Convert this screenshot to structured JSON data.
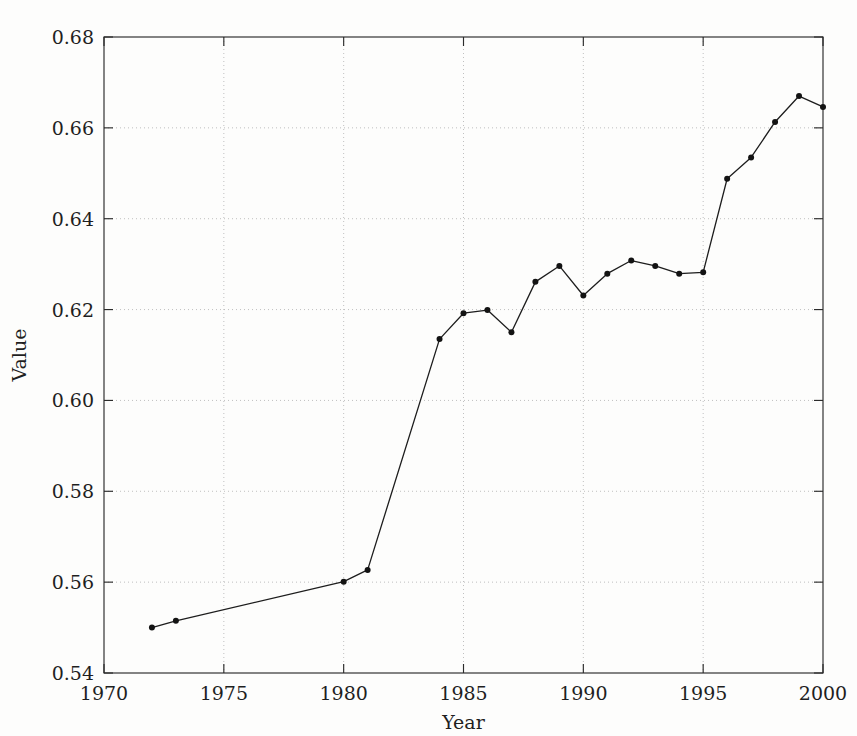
{
  "figure": {
    "top_partial_text": "",
    "background_color": "#fdfdfc",
    "line_color": "#1d1d1d",
    "marker_color": "#131313",
    "grid_color": "#b9b9b9",
    "axis_color": "#2b2b2b"
  },
  "chart_data": {
    "type": "line",
    "title": "",
    "xlabel": "Year",
    "ylabel": "Value",
    "xlim": [
      1970,
      2000
    ],
    "ylim": [
      0.54,
      0.68
    ],
    "xticks": [
      1970,
      1975,
      1980,
      1985,
      1990,
      1995,
      2000
    ],
    "xticklabels": [
      "1970",
      "1975",
      "1980",
      "1985",
      "1990",
      "1995",
      "2000"
    ],
    "yticks": [
      0.54,
      0.56,
      0.58,
      0.6,
      0.62,
      0.64,
      0.66,
      0.68
    ],
    "yticklabels": [
      "0.54",
      "0.56",
      "0.58",
      "0.60",
      "0.62",
      "0.64",
      "0.66",
      "0.68"
    ],
    "grid": true,
    "grid_style": "dotted",
    "legend": null,
    "marker": "circle",
    "x": [
      1972,
      1973,
      1980,
      1981,
      1984,
      1985,
      1986,
      1987,
      1988,
      1989,
      1990,
      1991,
      1992,
      1993,
      1994,
      1995,
      1996,
      1997,
      1998,
      1999,
      2000
    ],
    "values": [
      0.55,
      0.5515,
      0.5601,
      0.5627,
      0.6135,
      0.6192,
      0.6199,
      0.615,
      0.6261,
      0.6296,
      0.6231,
      0.6279,
      0.6308,
      0.6296,
      0.6279,
      0.6282,
      0.6488,
      0.6535,
      0.6613,
      0.667,
      0.6646
    ]
  }
}
